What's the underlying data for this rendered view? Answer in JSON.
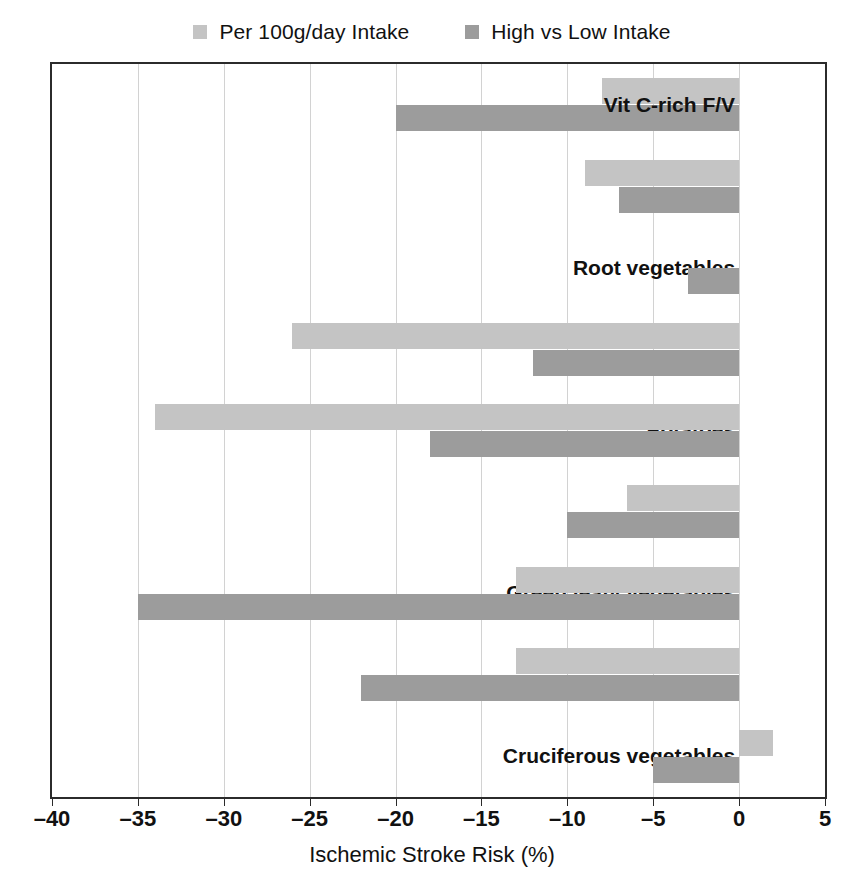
{
  "chart_data": {
    "type": "bar",
    "orientation": "horizontal",
    "title": "",
    "xlabel": "Ischemic Stroke Risk (%)",
    "ylabel": "",
    "xlim": [
      -40,
      5
    ],
    "xticks": [
      -40,
      -35,
      -30,
      -25,
      -20,
      -15,
      -10,
      -5,
      0,
      5
    ],
    "xtick_labels": [
      "–40",
      "–35",
      "–30",
      "–25",
      "–20",
      "–15",
      "–10",
      "–5",
      "0",
      "5"
    ],
    "grid": "vertical",
    "legend_position": "top-center",
    "categories": [
      "Vit C-rich F/V",
      "Root vegetables",
      "Potatoes",
      "Green leafy vegetables",
      "Cruciferous vegetables",
      "Allium vegetables",
      "100% Citrus fruit juices",
      "Citrus fruit",
      "Berries"
    ],
    "series": [
      {
        "name": "Per 100g/day Intake",
        "color": "#c4c4c4",
        "values": [
          -8,
          -9,
          0,
          -26,
          -34,
          -6.5,
          -13,
          -13,
          2
        ]
      },
      {
        "name": "High vs Low Intake",
        "color": "#9c9c9c",
        "values": [
          -20,
          -7,
          -3,
          -12,
          -18,
          -10,
          -35,
          -22,
          -5
        ]
      }
    ]
  },
  "legend": {
    "items": [
      {
        "label": "Per 100g/day Intake",
        "color": "#c4c4c4"
      },
      {
        "label": "High vs Low Intake",
        "color": "#9c9c9c"
      }
    ]
  },
  "axis": {
    "x_title": "Ischemic Stroke Risk (%)"
  },
  "colors": {
    "light_bar": "#c4c4c4",
    "dark_bar": "#9c9c9c",
    "frame": "#2b2b2b",
    "grid": "#d2d2d2",
    "text": "#111111",
    "background": "#ffffff"
  }
}
